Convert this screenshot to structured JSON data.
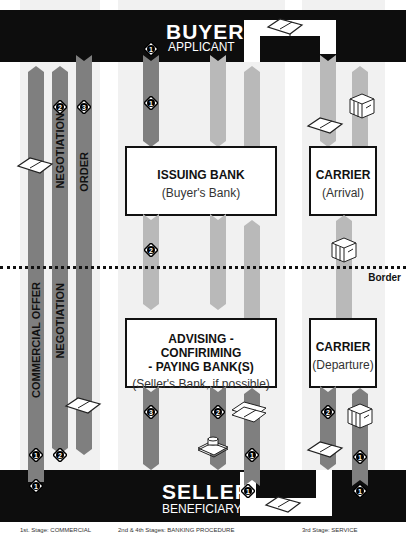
{
  "parties": {
    "buyer": {
      "title": "BUYER",
      "subtitle": "APPLICANT"
    },
    "seller": {
      "title": "SELLER",
      "subtitle": "BENEFICIARY"
    }
  },
  "boxes": {
    "issuing_bank": {
      "title": "ISSUING BANK",
      "subtitle": "(Buyer's Bank)"
    },
    "advising_bank": {
      "title_line1": "ADVISING - CONFIRIMING",
      "title_line2": "- PAYING  BANK(S)",
      "subtitle": "(Seller's Bank, if possible)"
    },
    "carrier_arrival": {
      "title": "CARRIER",
      "subtitle": "(Arrival)"
    },
    "carrier_departure": {
      "title": "CARRIER",
      "subtitle": "(Departure)"
    }
  },
  "flows": {
    "commercial_offer": "COMMERCIAL OFFER",
    "negotiation": "NEGOTIATION",
    "order": "ORDER"
  },
  "border_label": "Border",
  "badges": {
    "one": "1",
    "two": "2",
    "three": "3"
  },
  "captions": {
    "stage1": "1st. Stage: COMMERCIAL",
    "stage2_4": "2nd & 4th Stages: BANKING PROCEDURE",
    "stage3": "3rd Stage: SERVICE"
  },
  "colors": {
    "bar": "#0d0d0d",
    "dark_arrow": "#7f7f7f",
    "light_arrow": "#b9b9b9",
    "band": "#f1f1f1"
  }
}
